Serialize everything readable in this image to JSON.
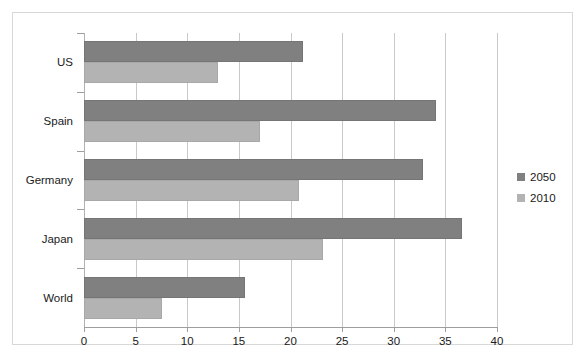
{
  "chart_data": {
    "type": "bar",
    "orientation": "horizontal",
    "title": "",
    "subtitle": "",
    "xlabel": "",
    "ylabel": "",
    "categories": [
      "US",
      "Spain",
      "Germany",
      "Japan",
      "World"
    ],
    "series": [
      {
        "name": "2050",
        "color": "#808080",
        "values": [
          21.2,
          34.1,
          32.8,
          36.6,
          15.6
        ]
      },
      {
        "name": "2010",
        "color": "#b3b3b3",
        "values": [
          13.0,
          17.0,
          20.8,
          23.1,
          7.6
        ]
      }
    ],
    "xlim": [
      0,
      40
    ],
    "xticks": [
      0,
      5,
      10,
      15,
      20,
      25,
      30,
      35,
      40
    ],
    "xtick_labels": [
      "0",
      "5",
      "10",
      "15",
      "20",
      "25",
      "30",
      "35",
      "40"
    ],
    "grid": true,
    "grid_axis": "x",
    "legend": {
      "position": "right",
      "entries": [
        {
          "label": "2050",
          "color": "#808080"
        },
        {
          "label": "2010",
          "color": "#b3b3b3"
        }
      ]
    },
    "annotations": []
  },
  "colors": {
    "series_2050": "#808080",
    "series_2010": "#b3b3b3",
    "gridline": "#c9c9c9",
    "axis": "#9e9e9e",
    "frame_border": "#d8d8d8",
    "background": "#ffffff",
    "text": "#1a1a1a"
  }
}
